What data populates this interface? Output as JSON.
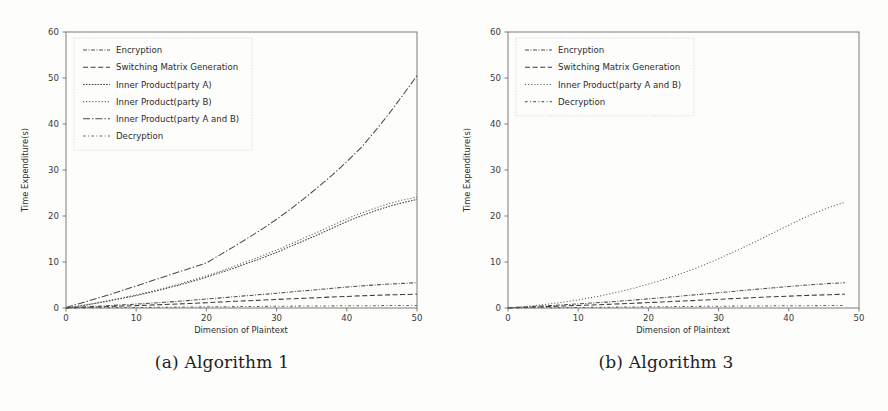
{
  "figure": {
    "background_color": "#fdfdfc",
    "panels": [
      {
        "caption": "(a) Algorithm 1",
        "xlabel": "Dimension of Plaintext",
        "ylabel": "Time Expenditure(s)"
      },
      {
        "caption": "(b) Algorithm 3",
        "xlabel": "Dimension of Plaintext",
        "ylabel": "Time Expenditure(s)"
      }
    ]
  },
  "chart_data": [
    {
      "type": "line",
      "title": "(a) Algorithm 1",
      "xlabel": "Dimension of Plaintext",
      "ylabel": "Time Expenditure(s)",
      "xlim": [
        0,
        50
      ],
      "ylim": [
        0,
        60
      ],
      "xticks": [
        0,
        10,
        20,
        30,
        40,
        50
      ],
      "yticks": [
        0,
        10,
        20,
        30,
        40,
        50,
        60
      ],
      "grid": false,
      "legend_position": "upper left",
      "x": [
        0,
        2,
        4,
        6,
        8,
        10,
        12,
        14,
        16,
        18,
        20,
        22,
        24,
        26,
        28,
        30,
        32,
        34,
        36,
        38,
        40,
        42,
        44,
        46,
        48,
        50
      ],
      "series": [
        {
          "name": "Encryption",
          "color": "#4d4d4d",
          "linestyle": "dashdot-dense",
          "values": [
            0.05,
            0.2,
            0.35,
            0.5,
            0.68,
            0.85,
            1.05,
            1.25,
            1.45,
            1.7,
            1.95,
            2.2,
            2.45,
            2.7,
            2.95,
            3.2,
            3.5,
            3.75,
            4.0,
            4.3,
            4.55,
            4.8,
            5.0,
            5.2,
            5.35,
            5.5
          ]
        },
        {
          "name": "Switching Matrix Generation",
          "color": "#3c3c3c",
          "linestyle": "dashed",
          "values": [
            0.03,
            0.12,
            0.22,
            0.32,
            0.42,
            0.52,
            0.65,
            0.75,
            0.88,
            1.0,
            1.15,
            1.3,
            1.45,
            1.58,
            1.72,
            1.85,
            2.0,
            2.12,
            2.25,
            2.4,
            2.52,
            2.65,
            2.75,
            2.85,
            2.92,
            3.0
          ]
        },
        {
          "name": "Inner Product(party A)",
          "color": "#454545",
          "linestyle": "dotted-dense",
          "values": [
            0.0,
            0.45,
            0.95,
            1.5,
            2.1,
            2.7,
            3.4,
            4.15,
            4.95,
            5.8,
            6.7,
            7.7,
            8.7,
            9.8,
            10.9,
            12.1,
            13.4,
            14.7,
            16.0,
            17.4,
            18.8,
            20.0,
            21.1,
            22.1,
            22.9,
            23.6
          ]
        },
        {
          "name": "Inner Product(party B)",
          "color": "#5a5a5a",
          "linestyle": "dotted",
          "values": [
            0.0,
            0.5,
            1.0,
            1.6,
            2.2,
            2.85,
            3.55,
            4.3,
            5.15,
            6.05,
            7.0,
            8.0,
            9.1,
            10.2,
            11.4,
            12.6,
            13.9,
            15.3,
            16.6,
            18.0,
            19.4,
            20.6,
            21.7,
            22.7,
            23.5,
            24.1
          ]
        },
        {
          "name": "Inner Product(party A and B)",
          "color": "#4a4a4a",
          "linestyle": "dashdot-long",
          "values": [
            0.1,
            1.0,
            1.9,
            2.8,
            3.8,
            4.8,
            5.8,
            6.8,
            7.8,
            8.8,
            9.8,
            11.6,
            13.4,
            15.3,
            17.2,
            19.3,
            21.5,
            23.9,
            26.4,
            29.0,
            31.8,
            34.8,
            38.4,
            42.2,
            46.3,
            50.5
          ]
        },
        {
          "name": "Decryption",
          "color": "#636363",
          "linestyle": "dashdot-loose",
          "values": [
            0.0,
            0.02,
            0.04,
            0.06,
            0.09,
            0.11,
            0.14,
            0.16,
            0.19,
            0.22,
            0.25,
            0.27,
            0.3,
            0.32,
            0.35,
            0.37,
            0.4,
            0.42,
            0.44,
            0.46,
            0.48,
            0.5,
            0.51,
            0.53,
            0.54,
            0.55
          ]
        }
      ]
    },
    {
      "type": "line",
      "title": "(b) Algorithm 3",
      "xlabel": "Dimension of Plaintext",
      "ylabel": "Time Expenditure(s)",
      "xlim": [
        0,
        50
      ],
      "ylim": [
        0,
        60
      ],
      "xticks": [
        0,
        10,
        20,
        30,
        40,
        50
      ],
      "yticks": [
        0,
        10,
        20,
        30,
        40,
        50,
        60
      ],
      "grid": false,
      "legend_position": "upper left",
      "x": [
        0,
        2,
        4,
        6,
        8,
        10,
        12,
        14,
        16,
        18,
        20,
        22,
        24,
        26,
        28,
        30,
        32,
        34,
        36,
        38,
        40,
        42,
        44,
        46,
        48
      ],
      "series": [
        {
          "name": "Encryption",
          "color": "#4d4d4d",
          "linestyle": "dashdot-dense",
          "values": [
            0.05,
            0.2,
            0.36,
            0.52,
            0.7,
            0.88,
            1.08,
            1.28,
            1.5,
            1.74,
            2.0,
            2.25,
            2.5,
            2.78,
            3.05,
            3.3,
            3.6,
            3.88,
            4.15,
            4.42,
            4.68,
            4.92,
            5.15,
            5.35,
            5.5
          ]
        },
        {
          "name": "Switching Matrix Generation",
          "color": "#3c3c3c",
          "linestyle": "dashed",
          "values": [
            0.03,
            0.12,
            0.22,
            0.33,
            0.44,
            0.55,
            0.67,
            0.78,
            0.9,
            1.03,
            1.18,
            1.32,
            1.46,
            1.6,
            1.75,
            1.9,
            2.04,
            2.18,
            2.32,
            2.46,
            2.58,
            2.7,
            2.8,
            2.9,
            3.0
          ]
        },
        {
          "name": "Inner Product(party A and B)",
          "color": "#5a5a5a",
          "linestyle": "dotted",
          "values": [
            0.0,
            0.25,
            0.55,
            0.9,
            1.3,
            1.75,
            2.3,
            2.9,
            3.6,
            4.35,
            5.2,
            6.1,
            7.1,
            8.2,
            9.4,
            10.7,
            12.1,
            13.5,
            15.0,
            16.5,
            18.0,
            19.5,
            20.8,
            22.0,
            23.0
          ]
        },
        {
          "name": "Decryption",
          "color": "#636363",
          "linestyle": "dashdot-loose",
          "values": [
            0.0,
            0.02,
            0.04,
            0.07,
            0.09,
            0.12,
            0.14,
            0.17,
            0.2,
            0.23,
            0.26,
            0.28,
            0.31,
            0.33,
            0.36,
            0.38,
            0.41,
            0.43,
            0.45,
            0.47,
            0.49,
            0.5,
            0.52,
            0.53,
            0.54
          ]
        }
      ]
    }
  ]
}
